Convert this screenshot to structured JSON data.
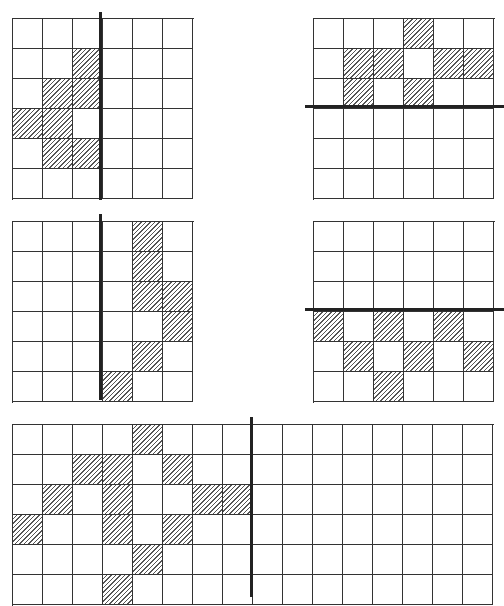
{
  "figure": {
    "cell_size_px": 30,
    "colors": {
      "line": "#333333",
      "axis": "#222222",
      "hatch": "#555555",
      "background": "#ffffff"
    },
    "grids": [
      {
        "id": "grid-top-left",
        "x": 12,
        "y": 18,
        "rows": 6,
        "cols": 6,
        "shaded": [
          [
            1,
            2
          ],
          [
            2,
            1
          ],
          [
            2,
            2
          ],
          [
            3,
            0
          ],
          [
            3,
            1
          ],
          [
            4,
            1
          ],
          [
            4,
            2
          ]
        ],
        "mirror": {
          "orientation": "vertical",
          "x": 100,
          "y1": 12,
          "y2": 200
        }
      },
      {
        "id": "grid-top-right",
        "x": 313,
        "y": 18,
        "rows": 6,
        "cols": 6,
        "shaded": [
          [
            0,
            3
          ],
          [
            1,
            1
          ],
          [
            1,
            2
          ],
          [
            1,
            4
          ],
          [
            1,
            5
          ],
          [
            2,
            1
          ],
          [
            2,
            3
          ]
        ],
        "mirror": {
          "orientation": "horizontal",
          "y": 106,
          "x1": 305,
          "x2": 504
        }
      },
      {
        "id": "grid-middle-left",
        "x": 12,
        "y": 221,
        "rows": 6,
        "cols": 6,
        "shaded": [
          [
            0,
            4
          ],
          [
            1,
            4
          ],
          [
            2,
            4
          ],
          [
            2,
            5
          ],
          [
            3,
            5
          ],
          [
            4,
            4
          ],
          [
            5,
            3
          ]
        ],
        "mirror": {
          "orientation": "vertical",
          "x": 100,
          "y1": 214,
          "y2": 400
        }
      },
      {
        "id": "grid-middle-right",
        "x": 313,
        "y": 221,
        "rows": 6,
        "cols": 6,
        "shaded": [
          [
            3,
            0
          ],
          [
            3,
            2
          ],
          [
            3,
            4
          ],
          [
            4,
            1
          ],
          [
            4,
            3
          ],
          [
            4,
            5
          ],
          [
            5,
            2
          ]
        ],
        "mirror": {
          "orientation": "horizontal",
          "y": 309,
          "x1": 305,
          "x2": 504
        }
      },
      {
        "id": "grid-bottom-wide",
        "x": 12,
        "y": 424,
        "rows": 6,
        "cols": 16,
        "shaded": [
          [
            0,
            4
          ],
          [
            1,
            2
          ],
          [
            1,
            3
          ],
          [
            1,
            5
          ],
          [
            2,
            1
          ],
          [
            2,
            3
          ],
          [
            2,
            6
          ],
          [
            2,
            7
          ],
          [
            3,
            0
          ],
          [
            3,
            3
          ],
          [
            3,
            5
          ],
          [
            4,
            4
          ],
          [
            5,
            3
          ]
        ],
        "mirror": {
          "orientation": "vertical",
          "x": 251,
          "y1": 417,
          "y2": 597
        }
      }
    ]
  }
}
